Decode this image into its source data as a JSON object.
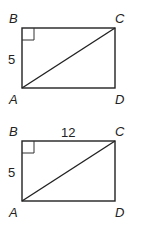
{
  "figures": [
    {
      "vertices": {
        "B": "B",
        "C": "C",
        "A": "A",
        "D": "D"
      },
      "side_left": "5",
      "side_top": ""
    },
    {
      "vertices": {
        "B": "B",
        "C": "C",
        "A": "A",
        "D": "D"
      },
      "side_left": "5",
      "side_top": "12"
    }
  ]
}
